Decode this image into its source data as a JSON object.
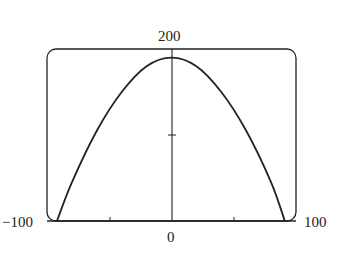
{
  "chart_data": {
    "type": "line",
    "title": "",
    "xlabel": "",
    "ylabel": "",
    "xlim": [
      -100,
      100
    ],
    "ylim": [
      0,
      200
    ],
    "grid": false,
    "tick_labels": {
      "x_min": "−100",
      "x_max": "100",
      "x_origin": "0",
      "y_max": "200"
    },
    "x_ticks": [
      -50,
      0,
      50
    ],
    "y_ticks": [
      100
    ],
    "series": [
      {
        "name": "curve",
        "description": "Downward-opening arch, peak near (0, 190), roots near x = -92 and x = 91",
        "x": [
          -92,
          -80,
          -60,
          -40,
          -20,
          0,
          20,
          40,
          60,
          80,
          91
        ],
        "y": [
          0,
          45,
          105,
          150,
          180,
          190,
          180,
          150,
          105,
          45,
          0
        ]
      }
    ],
    "legend": null
  }
}
